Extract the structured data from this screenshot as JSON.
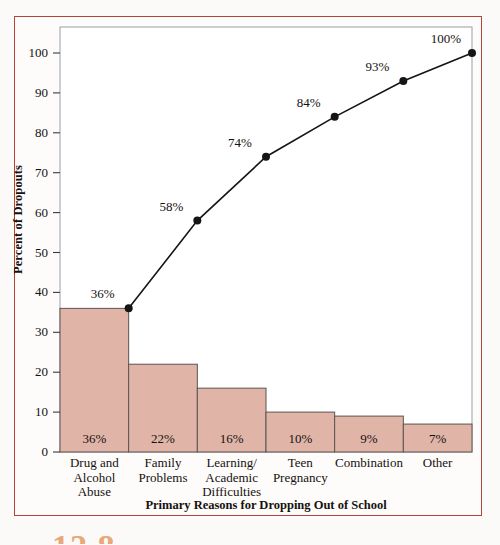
{
  "figure": {
    "number_partial": "12.8",
    "frame_color": "#b24437",
    "background_color": "#fdfcfa"
  },
  "chart_data": {
    "type": "bar",
    "title": "",
    "xlabel": "Primary Reasons for Dropping Out of School",
    "ylabel": "Percent of Dropouts",
    "categories": [
      "Drug and Alcohol Abuse",
      "Family Problems",
      "Learning/ Academic Difficulties",
      "Teen Pregnancy",
      "Combination",
      "Other"
    ],
    "category_lines": [
      [
        "Drug and",
        "Alcohol",
        "Abuse"
      ],
      [
        "Family",
        "Problems"
      ],
      [
        "Learning/",
        "Academic",
        "Difficulties"
      ],
      [
        "Teen",
        "Pregnancy"
      ],
      [
        "Combination"
      ],
      [
        "Other"
      ]
    ],
    "values": [
      36,
      22,
      16,
      10,
      9,
      7
    ],
    "bar_labels": [
      "36%",
      "22%",
      "16%",
      "10%",
      "9%",
      "7%"
    ],
    "series": [
      {
        "name": "Cumulative percent",
        "type": "line",
        "values": [
          36,
          58,
          74,
          84,
          93,
          100
        ],
        "labels": [
          "36%",
          "58%",
          "74%",
          "84%",
          "93%",
          "100%"
        ]
      }
    ],
    "ylim": [
      0,
      105
    ],
    "yticks": [
      0,
      10,
      20,
      30,
      40,
      50,
      60,
      70,
      80,
      90,
      100
    ],
    "ytick_labels": [
      "0",
      "10",
      "20",
      "30",
      "40",
      "50",
      "60",
      "70",
      "80",
      "90",
      "100"
    ],
    "grid": false,
    "legend": "none",
    "bar_fill_color": "#e0b5a8",
    "bar_edge_color": "#5b5450",
    "line_color": "#151515",
    "marker_color": "#151515"
  }
}
